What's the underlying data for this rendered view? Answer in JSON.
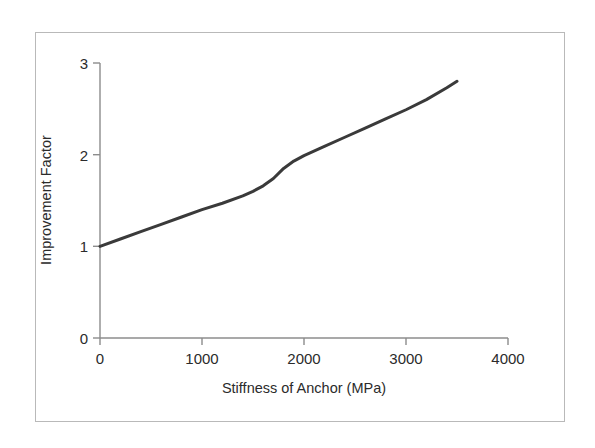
{
  "chart_data": {
    "type": "line",
    "title": "",
    "xlabel": "Stiffness of Anchor (MPa)",
    "ylabel": "Improvement Factor",
    "xlim": [
      0,
      4000
    ],
    "ylim": [
      0,
      3
    ],
    "xticks": [
      0,
      1000,
      2000,
      3000,
      4000
    ],
    "xtick_labels": [
      "0",
      "1000",
      "2000",
      "3000",
      "4000"
    ],
    "yticks": [
      0,
      1,
      2,
      3
    ],
    "ytick_labels": [
      "0",
      "1",
      "2",
      "3"
    ],
    "grid": false,
    "legend": null,
    "legend_position": "none",
    "series": [
      {
        "name": "Improvement Factor",
        "color": "#3a3a3a",
        "line_width": 3,
        "marker": "none",
        "x": [
          0,
          200,
          400,
          600,
          800,
          1000,
          1200,
          1400,
          1500,
          1600,
          1700,
          1800,
          1900,
          2000,
          2200,
          2400,
          2600,
          2800,
          3000,
          3200,
          3400,
          3500
        ],
        "y": [
          1.0,
          1.08,
          1.16,
          1.24,
          1.32,
          1.4,
          1.47,
          1.55,
          1.6,
          1.66,
          1.74,
          1.85,
          1.93,
          1.99,
          2.09,
          2.19,
          2.29,
          2.39,
          2.49,
          2.6,
          2.73,
          2.8
        ]
      }
    ],
    "annotations": []
  },
  "axes": {
    "x_title": "Stiffness of Anchor (MPa)",
    "y_title": "Improvement Factor",
    "x_tick_labels": [
      "0",
      "1000",
      "2000",
      "3000",
      "4000"
    ],
    "y_tick_labels": [
      "3",
      "2",
      "1",
      "0"
    ]
  },
  "style": {
    "axis_color": "#8c8c8c",
    "line_color": "#3a3a3a",
    "frame_color": "#b9b9b9",
    "text_color": "#2b2b2b",
    "background": "#ffffff"
  }
}
